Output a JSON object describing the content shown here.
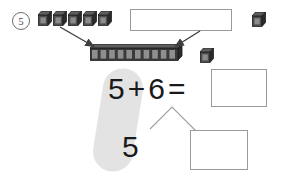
{
  "worksheet": {
    "problem_number": "5",
    "top_row": {
      "single_cubes_label": "unit-cube",
      "single_cubes_count": 5,
      "right_cube_label": "unit-cube",
      "answer_box_value": "",
      "answer_box_placeholder": ""
    },
    "middle_row": {
      "ten_stick_label": "ten-stick",
      "ten_stick_segments": 10,
      "side_cube_label": "unit-cube"
    },
    "equation": {
      "addend_1": "5",
      "plus": "+",
      "addend_2": "6",
      "equals": "=",
      "sum_value": "",
      "sum_placeholder": ""
    },
    "decomposition": {
      "part_left": "5",
      "part_right_value": "",
      "part_right_placeholder": ""
    },
    "colors": {
      "cube_dark": "#2b2b2b",
      "cube_face": "#4d4d4d",
      "cube_top": "#6b6b6b",
      "highlight": "#e3e3e3",
      "box_border": "#9a9a9a",
      "ink": "#1a1a1a",
      "arrow": "#3f3f3f"
    }
  }
}
